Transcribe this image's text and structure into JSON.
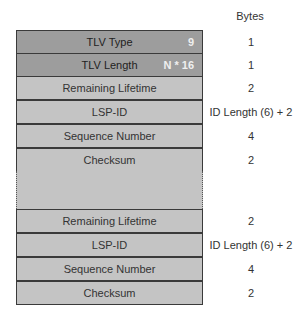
{
  "header": {
    "bytes_label": "Bytes"
  },
  "top_fields": [
    {
      "label": "TLV Type",
      "value": "9",
      "bytes": "1",
      "style": "dark"
    },
    {
      "label": "TLV Length",
      "value": "N * 16",
      "bytes": "1",
      "style": "dark"
    }
  ],
  "entry_1": [
    {
      "label": "Remaining Lifetime",
      "bytes": "2"
    },
    {
      "label": "LSP-ID",
      "bytes": "ID Length (6) + 2"
    },
    {
      "label": "Sequence Number",
      "bytes": "4"
    },
    {
      "label": "Checksum",
      "bytes": "2"
    }
  ],
  "entry_n": [
    {
      "label": "Remaining Lifetime",
      "bytes": "2"
    },
    {
      "label": "LSP-ID",
      "bytes": "ID Length (6) + 2"
    },
    {
      "label": "Sequence Number",
      "bytes": "4"
    },
    {
      "label": "Checksum",
      "bytes": "2"
    }
  ],
  "colors": {
    "dark_field": "#9d9d9d",
    "light_field": "#c4c4c4",
    "border": "#3a3a3a"
  }
}
